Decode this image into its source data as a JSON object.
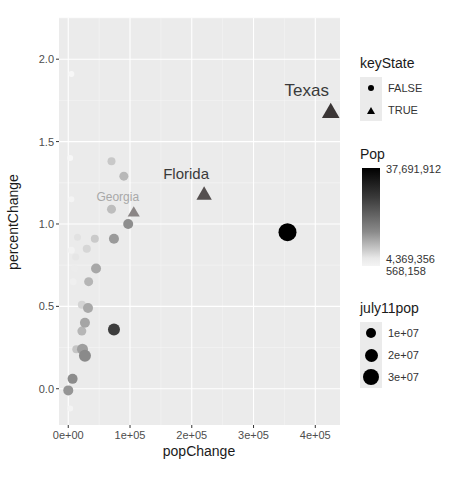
{
  "chart_data": {
    "type": "scatter",
    "title": "",
    "xlabel": "popChange",
    "ylabel": "percentChange",
    "xlim": [
      -15000,
      440000
    ],
    "ylim": [
      -0.22,
      2.25
    ],
    "x_ticks": [
      0,
      100000,
      200000,
      300000,
      400000
    ],
    "x_tick_labels": [
      "0e+00",
      "1e+05",
      "2e+05",
      "3e+05",
      "4e+05"
    ],
    "y_ticks": [
      0.0,
      0.5,
      1.0,
      1.5,
      2.0
    ],
    "y_tick_labels": [
      "0.0",
      "0.5",
      "1.0",
      "1.5",
      "2.0"
    ],
    "grid": true,
    "legend_position": "right",
    "points": [
      {
        "label": "Texas",
        "x": 425000,
        "y": 1.68,
        "keyState": true,
        "pop": 25700000,
        "shade": "#3a3535",
        "size": 8
      },
      {
        "label": "Florida",
        "x": 220000,
        "y": 1.18,
        "keyState": true,
        "pop": 19100000,
        "shade": "#555050",
        "size": 7
      },
      {
        "label": "Georgia",
        "x": 106000,
        "y": 1.07,
        "keyState": true,
        "pop": 9800000,
        "shade": "#8a8585",
        "size": 5.5
      },
      {
        "label": "",
        "x": 355000,
        "y": 0.95,
        "keyState": false,
        "pop": 37691912,
        "shade": "#000000",
        "size": 9
      },
      {
        "label": "",
        "x": 74000,
        "y": 0.36,
        "keyState": false,
        "pop": 12800000,
        "shade": "#3d3d3d",
        "size": 6
      },
      {
        "label": "",
        "x": 97000,
        "y": 1.0,
        "keyState": false,
        "pop": 6500000,
        "shade": "#8e8e8e",
        "size": 5
      },
      {
        "label": "",
        "x": 74000,
        "y": 0.91,
        "keyState": false,
        "pop": 6000000,
        "shade": "#9a9a9a",
        "size": 5
      },
      {
        "label": "",
        "x": 90000,
        "y": 1.29,
        "keyState": false,
        "pop": 3000000,
        "shade": "#b8b8b8",
        "size": 4.5
      },
      {
        "label": "",
        "x": 70000,
        "y": 1.38,
        "keyState": false,
        "pop": 2000000,
        "shade": "#c8c8c8",
        "size": 4
      },
      {
        "label": "",
        "x": 70000,
        "y": 1.09,
        "keyState": false,
        "pop": 2500000,
        "shade": "#bdbdbd",
        "size": 4.5
      },
      {
        "label": "",
        "x": 43000,
        "y": 0.91,
        "keyState": false,
        "pop": 2000000,
        "shade": "#cacaca",
        "size": 4
      },
      {
        "label": "",
        "x": 45000,
        "y": 0.73,
        "keyState": false,
        "pop": 4000000,
        "shade": "#a8a8a8",
        "size": 5
      },
      {
        "label": "",
        "x": 33000,
        "y": 0.65,
        "keyState": false,
        "pop": 3000000,
        "shade": "#b5b5b5",
        "size": 4.5
      },
      {
        "label": "",
        "x": 32000,
        "y": 0.49,
        "keyState": false,
        "pop": 4500000,
        "shade": "#a9a9a9",
        "size": 5
      },
      {
        "label": "",
        "x": 27000,
        "y": 0.4,
        "keyState": false,
        "pop": 4800000,
        "shade": "#a5a5a5",
        "size": 5
      },
      {
        "label": "",
        "x": 22000,
        "y": 0.35,
        "keyState": false,
        "pop": 3000000,
        "shade": "#b6b6b6",
        "size": 4.5
      },
      {
        "label": "",
        "x": 23000,
        "y": 0.24,
        "keyState": false,
        "pop": 5500000,
        "shade": "#9e9e9e",
        "size": 5.5
      },
      {
        "label": "",
        "x": 27000,
        "y": 0.2,
        "keyState": false,
        "pop": 9000000,
        "shade": "#8a8a8a",
        "size": 6
      },
      {
        "label": "",
        "x": 13000,
        "y": 0.24,
        "keyState": false,
        "pop": 2000000,
        "shade": "#c4c4c4",
        "size": 4
      },
      {
        "label": "",
        "x": 7000,
        "y": 0.06,
        "keyState": false,
        "pop": 5300000,
        "shade": "#8c8c8c",
        "size": 5
      },
      {
        "label": "",
        "x": 0,
        "y": -0.01,
        "keyState": false,
        "pop": 5000000,
        "shade": "#959595",
        "size": 5
      },
      {
        "label": "",
        "x": 22000,
        "y": 0.51,
        "keyState": false,
        "pop": 1500000,
        "shade": "#d4d4d4",
        "size": 4
      },
      {
        "label": "",
        "x": 30000,
        "y": 0.85,
        "keyState": false,
        "pop": 1500000,
        "shade": "#d6d6d6",
        "size": 4
      },
      {
        "label": "",
        "x": 15000,
        "y": 0.92,
        "keyState": false,
        "pop": 1000000,
        "shade": "#e2e2e2",
        "size": 3.5
      },
      {
        "label": "",
        "x": 12000,
        "y": 0.8,
        "keyState": false,
        "pop": 900000,
        "shade": "#e6e6e6",
        "size": 3.5
      },
      {
        "label": "",
        "x": 10000,
        "y": 0.73,
        "keyState": false,
        "pop": 800000,
        "shade": "#ececec",
        "size": 3.5
      },
      {
        "label": "",
        "x": 8000,
        "y": 0.65,
        "keyState": false,
        "pop": 700000,
        "shade": "#efefef",
        "size": 3.5
      },
      {
        "label": "",
        "x": 5000,
        "y": 0.84,
        "keyState": false,
        "pop": 600000,
        "shade": "#f2f2f2",
        "size": 3.5
      },
      {
        "label": "",
        "x": 5000,
        "y": 1.15,
        "keyState": false,
        "pop": 600000,
        "shade": "#f4f4f4",
        "size": 3
      },
      {
        "label": "",
        "x": 3000,
        "y": 1.4,
        "keyState": false,
        "pop": 568158,
        "shade": "#f7f7f7",
        "size": 3
      },
      {
        "label": "",
        "x": 5000,
        "y": 1.91,
        "keyState": false,
        "pop": 568158,
        "shade": "#f7f7f7",
        "size": 3
      },
      {
        "label": "",
        "x": 3000,
        "y": -0.12,
        "keyState": false,
        "pop": 600000,
        "shade": "#f4f4f4",
        "size": 3
      }
    ]
  },
  "legend": {
    "keyState": {
      "title": "keyState",
      "items": [
        {
          "label": "FALSE",
          "shape": "circle"
        },
        {
          "label": "TRUE",
          "shape": "triangle"
        }
      ]
    },
    "pop": {
      "title": "Pop",
      "max_label": "37,691,912",
      "mid_label": "4,369,356",
      "min_label": "568,158"
    },
    "july11pop": {
      "title": "july11pop",
      "items": [
        {
          "label": "1e+07",
          "size": 5
        },
        {
          "label": "2e+07",
          "size": 6.5
        },
        {
          "label": "3e+07",
          "size": 8
        }
      ]
    }
  }
}
